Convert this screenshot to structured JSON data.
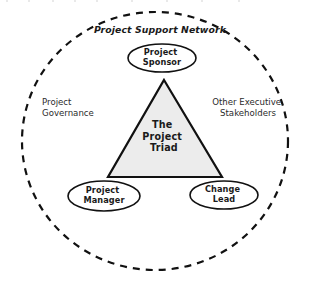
{
  "diagram": {
    "title": "Project Support Network",
    "outer_boundary": {
      "name": "Project Support Network",
      "shape": "dashed-circle",
      "center_x": 155,
      "center_y": 141,
      "radius_x": 133,
      "radius_y": 129,
      "stroke": "#111111",
      "fill": "#ffffff",
      "dash": "7 6",
      "stroke_width": 2.2
    },
    "title_position": {
      "x": 160,
      "y": 33
    },
    "core": {
      "label_lines": [
        "The",
        "Project",
        "Triad"
      ],
      "shape": "triangle",
      "apex_x": 164,
      "apex_y": 80,
      "base_y": 177,
      "base_left_x": 108,
      "base_right_x": 222,
      "fill": "#ececec",
      "stroke": "#111111",
      "stroke_width": 2.2,
      "text_x": 164,
      "text_y": 132,
      "line_height": 11.5
    },
    "nodes": [
      {
        "id": "project-sponsor",
        "label_lines": [
          "Project",
          "Sponsor"
        ],
        "cx": 162,
        "cy": 58,
        "rx": 34,
        "ry": 14,
        "fill": "#ffffff",
        "stroke": "#111111",
        "stroke_width": 1.6,
        "text_y": 55,
        "line_height": 9.5
      },
      {
        "id": "project-manager",
        "label_lines": [
          "Project",
          "Manager"
        ],
        "cx": 104,
        "cy": 196,
        "rx": 36,
        "ry": 15,
        "fill": "#ffffff",
        "stroke": "#111111",
        "stroke_width": 1.6,
        "text_y": 193,
        "line_height": 9.5
      },
      {
        "id": "change-lead",
        "label_lines": [
          "Change",
          "Lead"
        ],
        "cx": 224,
        "cy": 195,
        "rx": 34,
        "ry": 14,
        "fill": "#ffffff",
        "stroke": "#111111",
        "stroke_width": 1.6,
        "text_y": 192,
        "line_height": 9.5
      }
    ],
    "side_labels": [
      {
        "id": "project-governance",
        "lines": [
          "Project",
          "Governance"
        ],
        "x": 42,
        "y": 105,
        "anchor": "start",
        "line_height": 11
      },
      {
        "id": "other-executive-stakeholders",
        "lines": [
          "Other Executive",
          "Stakeholders"
        ],
        "x": 248,
        "y": 105,
        "anchor": "middle",
        "line_height": 11
      }
    ]
  },
  "colors": {
    "background": "#ffffff",
    "stroke": "#111111",
    "triangle_fill": "#ececec",
    "text": "#1a1a1a"
  }
}
